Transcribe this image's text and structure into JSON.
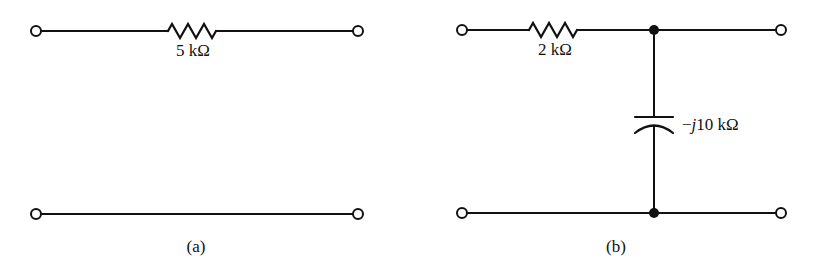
{
  "figure": {
    "circuits": [
      {
        "id": "a",
        "caption": "(a)",
        "components": [
          {
            "type": "resistor",
            "label": "5 kΩ",
            "position": "series-top"
          }
        ],
        "terminals": 4
      },
      {
        "id": "b",
        "caption": "(b)",
        "components": [
          {
            "type": "resistor",
            "label": "2 kΩ",
            "position": "series-top"
          },
          {
            "type": "capacitor",
            "label_prefix": "−",
            "label_j": "j",
            "label_value": "10 kΩ",
            "position": "shunt"
          }
        ],
        "terminals": 4,
        "junction_nodes": 2
      }
    ],
    "labels": {
      "a_resistor": "5 kΩ",
      "b_resistor": "2 kΩ",
      "b_cap_minus": "−",
      "b_cap_j": "j",
      "b_cap_value": "10 kΩ",
      "caption_a": "(a)",
      "caption_b": "(b)"
    }
  }
}
